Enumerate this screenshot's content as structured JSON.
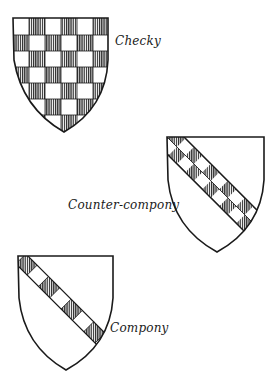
{
  "figure": {
    "colors": {
      "line": "#1a1a1a",
      "hatch": "#3a3a3a",
      "field": "#ffffff"
    },
    "shields": [
      {
        "id": "checky",
        "label": "Checky",
        "pattern": "checky",
        "columns": 6,
        "rows": 7
      },
      {
        "id": "counter-compony",
        "label": "Counter-compony",
        "pattern": "bend counter-compony",
        "rows": 2
      },
      {
        "id": "compony",
        "label": "Compony",
        "pattern": "bend compony",
        "rows": 1
      }
    ]
  }
}
